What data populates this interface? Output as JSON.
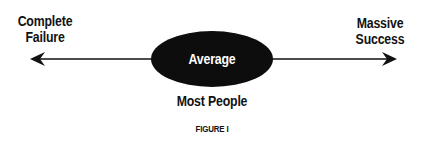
{
  "diagram": {
    "left_label": {
      "line1": "Complete",
      "line2": "Failure"
    },
    "right_label": {
      "line1": "Massive",
      "line2": "Success"
    },
    "center_label": "Average",
    "below_center_label": "Most People",
    "caption": "FIGURE I",
    "colors": {
      "ellipse": "#0d0d0d",
      "ellipse_text": "#ffffff",
      "line": "#111111"
    }
  }
}
